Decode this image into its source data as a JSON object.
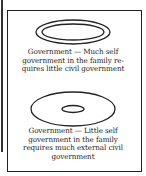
{
  "panels": [
    {
      "caption_lines": [
        "Government — Much self",
        "government in the family re-",
        "quires little civil government"
      ],
      "diagram": {
        "outer": {
          "cx": 73,
          "cy": 32,
          "rx": 37,
          "ry": 12
        },
        "inner": {
          "cx": 73,
          "cy": 32,
          "rx": 31,
          "ry": 8
        }
      }
    },
    {
      "caption_lines": [
        "Government — Little self",
        "government in the family",
        "requires much external civil",
        "government"
      ],
      "diagram": {
        "outer": {
          "cx": 73,
          "cy": 109,
          "rx": 42,
          "ry": 17
        },
        "inner": {
          "cx": 73,
          "cy": 109,
          "rx": 11,
          "ry": 3.5
        }
      }
    }
  ],
  "colors": {
    "stroke": "#222222",
    "background": "#ffffff"
  }
}
